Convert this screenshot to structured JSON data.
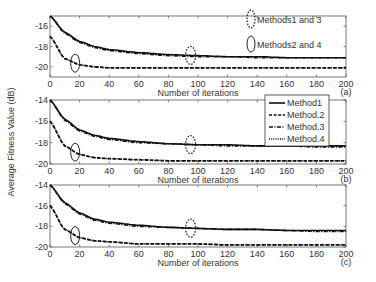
{
  "ylabel": "Average Fitness Value (dB)",
  "xlabel": "Number of iterations",
  "legend": {
    "items": [
      {
        "label": "Method1",
        "style": "solid"
      },
      {
        "label": "Method.2",
        "style": "dashed"
      },
      {
        "label": "Method.3",
        "style": "dashdot"
      },
      {
        "label": "Method.4",
        "style": "dotted"
      }
    ]
  },
  "annotations": {
    "dotted_ellipse": "Methods1 and 3",
    "solid_ellipse": "Methods2 and 4"
  },
  "panels": [
    {
      "tag": "(a)",
      "yticks": [
        "-16",
        "-18",
        "-20"
      ]
    },
    {
      "tag": "(b)",
      "yticks": [
        "-14",
        "-16",
        "-18",
        "-20"
      ]
    },
    {
      "tag": "(c)",
      "yticks": [
        "-14",
        "-16",
        "-18",
        "-20"
      ]
    }
  ],
  "xticks": [
    "0",
    "20",
    "40",
    "60",
    "80",
    "100",
    "120",
    "140",
    "160",
    "180",
    "200"
  ],
  "chart_data": [
    {
      "type": "line",
      "title": "(a)",
      "xlabel": "Number of iterations",
      "ylabel": "Average Fitness Value (dB)",
      "xlim": [
        0,
        200
      ],
      "ylim": [
        -21,
        -15
      ],
      "x": [
        0,
        10,
        20,
        30,
        40,
        60,
        80,
        100,
        120,
        140,
        160,
        180,
        200
      ],
      "series": [
        {
          "name": "Method1",
          "values": [
            -15.0,
            -16.6,
            -17.5,
            -18.0,
            -18.3,
            -18.6,
            -18.8,
            -18.9,
            -19.0,
            -19.0,
            -19.1,
            -19.1,
            -19.1
          ]
        },
        {
          "name": "Method.2",
          "values": [
            -17.0,
            -19.2,
            -19.8,
            -20.0,
            -20.1,
            -20.1,
            -20.1,
            -20.1,
            -20.1,
            -20.1,
            -20.1,
            -20.1,
            -20.1
          ]
        },
        {
          "name": "Method.3",
          "values": [
            -15.0,
            -16.7,
            -17.6,
            -18.1,
            -18.4,
            -18.7,
            -18.9,
            -19.0,
            -19.0,
            -19.1,
            -19.1,
            -19.1,
            -19.1
          ]
        },
        {
          "name": "Method.4",
          "values": [
            -17.0,
            -19.2,
            -19.8,
            -20.0,
            -20.1,
            -20.1,
            -20.1,
            -20.1,
            -20.1,
            -20.1,
            -20.1,
            -20.1,
            -20.1
          ]
        }
      ],
      "annotations": [
        "Methods1 and 3",
        "Methods2 and 4"
      ],
      "grid": false
    },
    {
      "type": "line",
      "title": "(b)",
      "xlabel": "Number of iterations",
      "ylabel": "Average Fitness Value (dB)",
      "xlim": [
        0,
        200
      ],
      "ylim": [
        -20,
        -14
      ],
      "x": [
        0,
        10,
        20,
        30,
        40,
        60,
        80,
        100,
        120,
        140,
        160,
        180,
        200
      ],
      "series": [
        {
          "name": "Method1",
          "values": [
            -14.0,
            -15.8,
            -16.8,
            -17.3,
            -17.6,
            -17.9,
            -18.1,
            -18.2,
            -18.2,
            -18.3,
            -18.3,
            -18.3,
            -18.3
          ]
        },
        {
          "name": "Method.2",
          "values": [
            -16.0,
            -18.3,
            -19.1,
            -19.4,
            -19.5,
            -19.6,
            -19.7,
            -19.7,
            -19.7,
            -19.7,
            -19.7,
            -19.7,
            -19.7
          ]
        },
        {
          "name": "Method.3",
          "values": [
            -14.0,
            -15.9,
            -16.9,
            -17.4,
            -17.7,
            -18.0,
            -18.1,
            -18.2,
            -18.3,
            -18.3,
            -18.3,
            -18.4,
            -18.4
          ]
        },
        {
          "name": "Method.4",
          "values": [
            -16.0,
            -18.3,
            -19.1,
            -19.4,
            -19.5,
            -19.6,
            -19.7,
            -19.7,
            -19.7,
            -19.7,
            -19.7,
            -19.7,
            -19.7
          ]
        }
      ],
      "legend_position": "upper right",
      "grid": false
    },
    {
      "type": "line",
      "title": "(c)",
      "xlabel": "Number of iterations",
      "ylabel": "Average Fitness Value (dB)",
      "xlim": [
        0,
        200
      ],
      "ylim": [
        -20,
        -14
      ],
      "x": [
        0,
        10,
        20,
        30,
        40,
        60,
        80,
        100,
        120,
        140,
        160,
        180,
        200
      ],
      "series": [
        {
          "name": "Method1",
          "values": [
            -14.0,
            -15.7,
            -16.7,
            -17.3,
            -17.6,
            -17.9,
            -18.1,
            -18.2,
            -18.3,
            -18.3,
            -18.4,
            -18.4,
            -18.4
          ]
        },
        {
          "name": "Method.2",
          "values": [
            -16.0,
            -18.3,
            -19.1,
            -19.4,
            -19.5,
            -19.7,
            -19.7,
            -19.7,
            -19.8,
            -19.8,
            -19.8,
            -19.8,
            -19.8
          ]
        },
        {
          "name": "Method.3",
          "values": [
            -14.0,
            -15.8,
            -16.8,
            -17.4,
            -17.7,
            -18.0,
            -18.1,
            -18.2,
            -18.3,
            -18.3,
            -18.4,
            -18.5,
            -18.5
          ]
        },
        {
          "name": "Method.4",
          "values": [
            -16.0,
            -18.3,
            -19.1,
            -19.4,
            -19.5,
            -19.7,
            -19.7,
            -19.7,
            -19.8,
            -19.8,
            -19.8,
            -19.8,
            -19.8
          ]
        }
      ],
      "grid": false
    }
  ]
}
